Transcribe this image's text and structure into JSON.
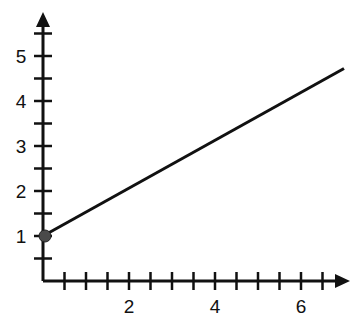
{
  "chart_data": {
    "type": "line",
    "title": "",
    "xlabel": "",
    "ylabel": "",
    "xlim": [
      0,
      7
    ],
    "ylim": [
      0,
      5.5
    ],
    "x_ticks_minor_step": 0.5,
    "y_ticks_minor_step": 0.5,
    "x_tick_labels": [
      "2",
      "4",
      "6"
    ],
    "x_tick_label_values": [
      2,
      4,
      6
    ],
    "y_tick_labels": [
      "1",
      "2",
      "3",
      "4",
      "5"
    ],
    "y_tick_label_values": [
      1,
      2,
      3,
      4,
      5
    ],
    "grid": false,
    "series": [
      {
        "name": "line",
        "equation": "y = 0.5x + 1",
        "x": [
          0,
          7
        ],
        "y": [
          1,
          4.5
        ],
        "start_point_marker": {
          "x": 0,
          "y": 1,
          "filled": true
        }
      }
    ],
    "colors": {
      "axis": "#111111",
      "line": "#111111",
      "marker": "#4a4a4a"
    }
  }
}
